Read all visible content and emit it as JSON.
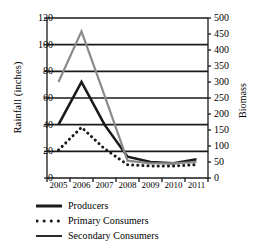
{
  "chart_data": {
    "type": "line",
    "title": "",
    "xlabel": "",
    "ylabel": "Rainfall (inches)",
    "y2label": "Biomass",
    "grid": true,
    "legend_position": "bottom-left",
    "categories": [
      "2005",
      "2006",
      "2007",
      "2008",
      "2009",
      "2010",
      "2011"
    ],
    "xtick_labels": [
      "2005",
      "2006",
      "2007",
      "2008",
      "2009",
      "2010",
      "2011"
    ],
    "ylim": [
      0,
      120
    ],
    "ytick_labels": [
      "0",
      "20",
      "40",
      "60",
      "80",
      "100",
      "120"
    ],
    "ytick_values": [
      0,
      20,
      40,
      60,
      80,
      100,
      120
    ],
    "y2lim": [
      0,
      500
    ],
    "y2tick_labels": [
      "0",
      "50",
      "100",
      "150",
      "200",
      "250",
      "300",
      "350",
      "400",
      "450",
      "500"
    ],
    "y2tick_values": [
      0,
      50,
      100,
      150,
      200,
      250,
      300,
      350,
      400,
      450,
      500
    ],
    "series": [
      {
        "name": "Producers",
        "style": "solid-thick-black",
        "color": "#1a1a1a",
        "axis": "left",
        "values": [
          40,
          72,
          40,
          16,
          12,
          11,
          14
        ]
      },
      {
        "name": "Primary Consumers",
        "style": "dotted-black",
        "color": "#1a1a1a",
        "axis": "left",
        "values": [
          21,
          38,
          22,
          10,
          9,
          9,
          10
        ]
      },
      {
        "name": "Secondary Consumers",
        "style": "solid-gray",
        "color": "#8a8a8a",
        "axis": "left",
        "values": [
          72,
          110,
          62,
          13,
          11,
          11,
          12
        ]
      }
    ]
  },
  "legend": {
    "items": [
      {
        "label": "Producers",
        "swatch": "thick-solid-line-icon"
      },
      {
        "label": "Primary Consumers",
        "swatch": "dotted-line-icon"
      },
      {
        "label": "Secondary Consumers",
        "swatch": "solid-line-icon"
      }
    ]
  }
}
